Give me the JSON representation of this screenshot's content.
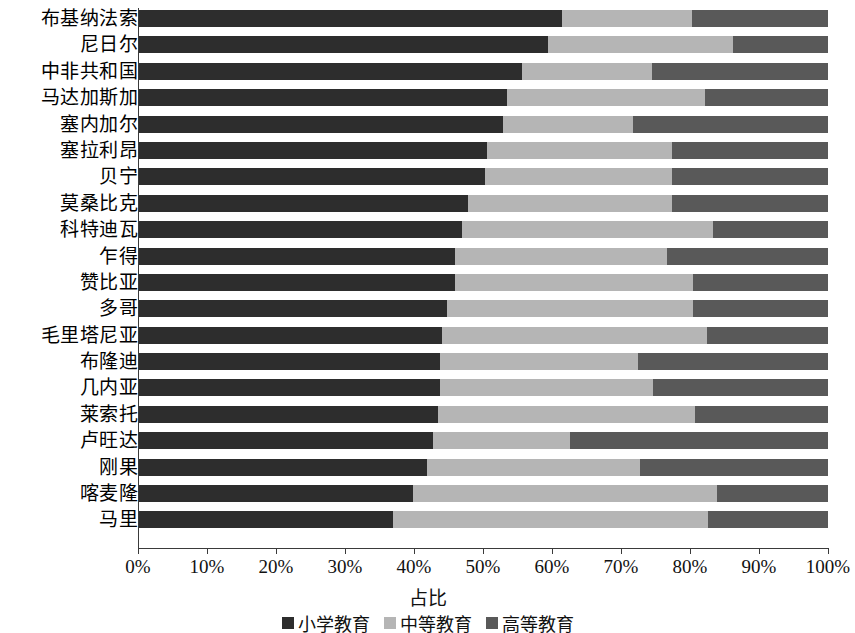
{
  "chart_data": {
    "type": "bar",
    "orientation": "horizontal",
    "stacked": true,
    "normalized": true,
    "title": "",
    "xlabel": "占比",
    "ylabel": "",
    "xlim": [
      0,
      100
    ],
    "xtick_labels": [
      "0%",
      "10%",
      "20%",
      "30%",
      "40%",
      "50%",
      "60%",
      "70%",
      "80%",
      "90%",
      "100%"
    ],
    "xtick_values": [
      0,
      10,
      20,
      30,
      40,
      50,
      60,
      70,
      80,
      90,
      100
    ],
    "grid": false,
    "legend_position": "bottom",
    "categories": [
      "布基纳法索",
      "尼日尔",
      "中非共和国",
      "马达加斯加",
      "塞内加尔",
      "塞拉利昂",
      "贝宁",
      "莫桑比克",
      "科特迪瓦",
      "乍得",
      "赞比亚",
      "多哥",
      "毛里塔尼亚",
      "布隆迪",
      "几内亚",
      "莱索托",
      "卢旺达",
      "刚果",
      "喀麦隆",
      "马里"
    ],
    "series": [
      {
        "name": "小学教育",
        "color": "#2d2d2d",
        "values": [
          61.4,
          59.4,
          55.6,
          53.5,
          52.9,
          50.6,
          50.3,
          47.8,
          46.9,
          45.9,
          45.9,
          44.8,
          44.0,
          43.8,
          43.8,
          43.5,
          42.8,
          41.9,
          39.9,
          37.0
        ]
      },
      {
        "name": "中等教育",
        "color": "#b5b5b5",
        "values": [
          18.9,
          26.8,
          18.9,
          28.7,
          18.9,
          26.8,
          27.1,
          29.6,
          36.4,
          30.7,
          34.5,
          35.6,
          38.5,
          28.7,
          30.8,
          37.2,
          19.8,
          30.9,
          44.0,
          45.6
        ]
      },
      {
        "name": "高等教育",
        "color": "#595959",
        "values": [
          19.7,
          13.8,
          25.5,
          17.8,
          28.2,
          22.6,
          22.6,
          22.6,
          16.7,
          23.4,
          19.6,
          19.6,
          17.5,
          27.5,
          25.4,
          19.3,
          37.4,
          27.2,
          16.1,
          17.4
        ]
      }
    ]
  }
}
